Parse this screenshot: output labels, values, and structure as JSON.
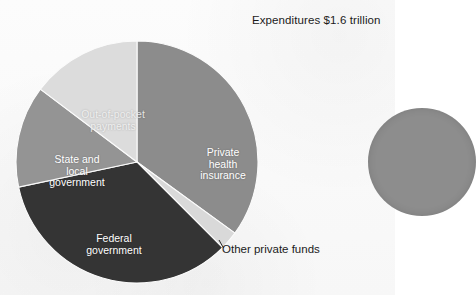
{
  "chart_data": {
    "type": "pie",
    "title": "Expenditures $1.6 trillion",
    "total_label": "$1.6 trillion",
    "categories": [
      "Private health insurance",
      "Other private funds",
      "Federal government",
      "State and local government",
      "Out-of-pocket payments"
    ],
    "values": [
      35,
      2.5,
      34,
      13.5,
      15
    ],
    "start_angle_deg": 0,
    "direction": "clockwise",
    "legend": "none",
    "labels_position": "inside-slices",
    "slices": [
      {
        "name": "private-health-insurance",
        "label_lines": [
          "Private",
          "health",
          "insurance"
        ],
        "value": 35,
        "start_deg": 0,
        "end_deg": 126,
        "color": "#8c8c8c",
        "label_color": "#ffffff",
        "label_placement": "inside"
      },
      {
        "name": "other-private-funds",
        "label_lines": [
          "Other private funds"
        ],
        "value": 2.5,
        "start_deg": 126,
        "end_deg": 135,
        "color": "#d9d9d9",
        "label_color": "#1b1b1b",
        "label_placement": "outside-leader"
      },
      {
        "name": "federal-government",
        "label_lines": [
          "Federal",
          "government"
        ],
        "value": 34,
        "start_deg": 135,
        "end_deg": 258,
        "color": "#343434",
        "label_color": "#ffffff",
        "label_placement": "inside"
      },
      {
        "name": "state-and-local-government",
        "label_lines": [
          "State and",
          "local",
          "government"
        ],
        "value": 13.5,
        "start_deg": 258,
        "end_deg": 307,
        "color": "#949494",
        "label_color": "#ffffff",
        "label_placement": "inside"
      },
      {
        "name": "out-of-pocket-payments",
        "label_lines": [
          "Out-of-pocket",
          "payments"
        ],
        "value": 15,
        "start_deg": 307,
        "end_deg": 360,
        "color": "#dcdcdc",
        "label_color": "#f2f2f2",
        "label_placement": "inside"
      }
    ]
  },
  "title": {
    "text": "Expenditures $1.6 trillion"
  },
  "labels": {
    "private_health_insurance": {
      "line1": "Private",
      "line2": "health",
      "line3": "insurance"
    },
    "out_of_pocket_payments": {
      "line1": "Out-of-pocket",
      "line2": "payments"
    },
    "state_and_local_government": {
      "line1": "State and",
      "line2": "local",
      "line3": "government"
    },
    "federal_government": {
      "line1": "Federal",
      "line2": "government"
    },
    "other_private_funds": {
      "text": "Other private funds"
    }
  },
  "colors": {
    "private_health_insurance": "#8c8c8c",
    "other_private_funds": "#d9d9d9",
    "federal_government": "#343434",
    "state_and_local_government": "#949494",
    "out_of_pocket_payments": "#dcdcdc",
    "secondary_pie": "#8d8d8d",
    "text_dark": "#1b1b1b",
    "text_light": "#ffffff",
    "background": "#fdfdfd"
  },
  "secondary_chart": {
    "name": "partial-pie-right-edge",
    "visible": "clipped"
  }
}
